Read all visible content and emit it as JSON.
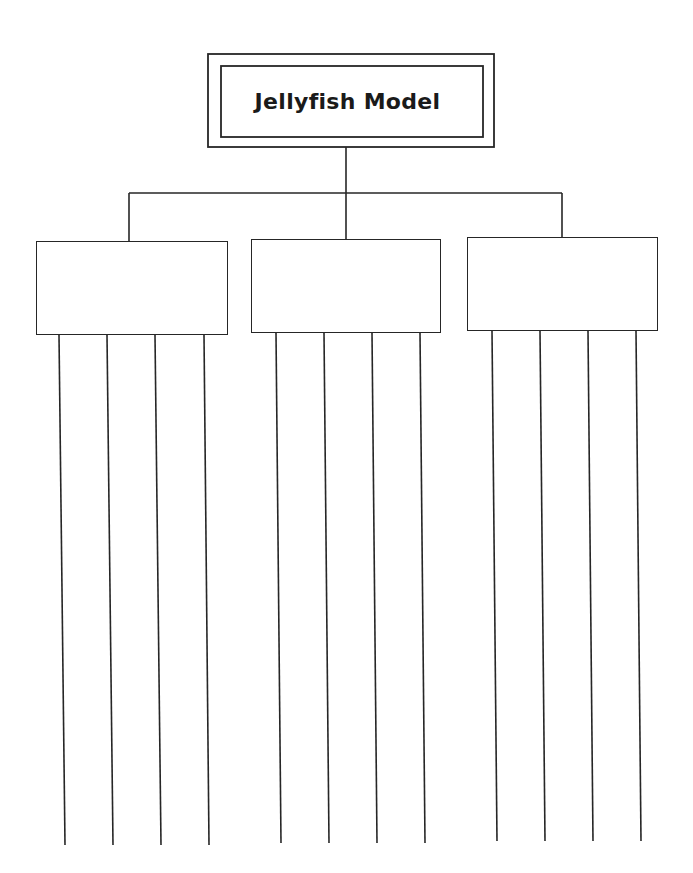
{
  "diagram": {
    "title": "Jellyfish Model",
    "line_color": "#262626",
    "background": "#ffffff",
    "title_box": {
      "outer": {
        "x": 208,
        "y": 54,
        "w": 286,
        "h": 93
      },
      "inner": {
        "x": 221,
        "y": 66,
        "w": 262,
        "h": 71
      }
    },
    "connectors": {
      "trunk": {
        "x": 346,
        "y1": 147,
        "y2": 239
      },
      "bar": {
        "y": 193,
        "x1": 129,
        "x2": 562
      },
      "drops": [
        {
          "x": 129,
          "y1": 193,
          "y2": 241
        },
        {
          "x": 562,
          "y1": 193,
          "y2": 237
        }
      ]
    },
    "categories": [
      {
        "label": "",
        "box": {
          "x": 36,
          "y": 241,
          "w": 192,
          "h": 94
        },
        "legs": [
          {
            "x1": 59,
            "y1": 335,
            "x2": 65,
            "y2": 845,
            "label": ""
          },
          {
            "x1": 107,
            "y1": 335,
            "x2": 113,
            "y2": 845,
            "label": ""
          },
          {
            "x1": 155,
            "y1": 335,
            "x2": 161,
            "y2": 845,
            "label": ""
          },
          {
            "x1": 204,
            "y1": 335,
            "x2": 209,
            "y2": 845,
            "label": ""
          }
        ]
      },
      {
        "label": "",
        "box": {
          "x": 251,
          "y": 239,
          "w": 190,
          "h": 94
        },
        "legs": [
          {
            "x1": 276,
            "y1": 333,
            "x2": 281,
            "y2": 843,
            "label": ""
          },
          {
            "x1": 324,
            "y1": 333,
            "x2": 329,
            "y2": 843,
            "label": ""
          },
          {
            "x1": 372,
            "y1": 333,
            "x2": 377,
            "y2": 843,
            "label": ""
          },
          {
            "x1": 420,
            "y1": 333,
            "x2": 425,
            "y2": 843,
            "label": ""
          }
        ]
      },
      {
        "label": "",
        "box": {
          "x": 467,
          "y": 237,
          "w": 191,
          "h": 94
        },
        "legs": [
          {
            "x1": 492,
            "y1": 331,
            "x2": 497,
            "y2": 841,
            "label": ""
          },
          {
            "x1": 540,
            "y1": 331,
            "x2": 545,
            "y2": 841,
            "label": ""
          },
          {
            "x1": 588,
            "y1": 331,
            "x2": 593,
            "y2": 841,
            "label": ""
          },
          {
            "x1": 636,
            "y1": 331,
            "x2": 641,
            "y2": 841,
            "label": ""
          }
        ]
      }
    ]
  }
}
